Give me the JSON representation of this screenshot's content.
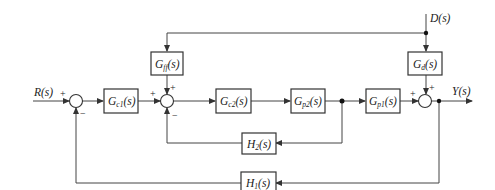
{
  "diagram": {
    "type": "control-system block diagram",
    "signals": {
      "input": "R(s)",
      "disturbance": "D(s)",
      "output": "Y(s)"
    },
    "blocks": [
      {
        "id": "gc1",
        "base": "G",
        "sub": "c1",
        "arg": "(s)"
      },
      {
        "id": "gff",
        "base": "G",
        "sub": "ff",
        "arg": "(s)"
      },
      {
        "id": "gc2",
        "base": "G",
        "sub": "c2",
        "arg": "(s)"
      },
      {
        "id": "gp2",
        "base": "G",
        "sub": "p2",
        "arg": "(s)"
      },
      {
        "id": "gp1",
        "base": "G",
        "sub": "p1",
        "arg": "(s)"
      },
      {
        "id": "gd",
        "base": "G",
        "sub": "d",
        "arg": "(s)"
      },
      {
        "id": "h2",
        "base": "H",
        "sub": "2",
        "arg": "(s)"
      },
      {
        "id": "h1",
        "base": "H",
        "sub": "1",
        "arg": "(s)"
      }
    ],
    "summing_junctions": [
      {
        "id": "sum1",
        "signs": {
          "left": "+",
          "bottom": "−"
        }
      },
      {
        "id": "sum2",
        "signs": {
          "left": "+",
          "top": "+",
          "bottom": "−"
        }
      },
      {
        "id": "sum3",
        "signs": {
          "left": "+",
          "top": "+"
        }
      }
    ]
  }
}
